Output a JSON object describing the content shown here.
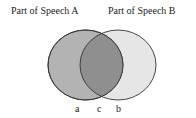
{
  "diagram": {
    "type": "venn",
    "sets": [
      {
        "id": "A",
        "title": "Part of Speech A",
        "region_label": "a",
        "fill": "#b3b3b3"
      },
      {
        "id": "B",
        "title": "Part of Speech B",
        "region_label": "b",
        "fill": "#e6e6e6"
      }
    ],
    "intersection": {
      "region_label": "c",
      "fill": "#8f8f8f"
    },
    "stroke": "#333333"
  }
}
